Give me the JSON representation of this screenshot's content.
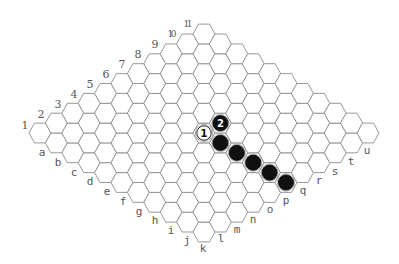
{
  "board": {
    "size": 11,
    "origin": [
      40,
      133
    ],
    "step": [
      16.4,
      9.9
    ],
    "hex_half_width": 11,
    "hex_half_height": 9.9,
    "line_color": "#8c8c8c"
  },
  "row_labels": [
    {
      "text": "1",
      "x": 25,
      "y": 129
    },
    {
      "text": "2",
      "x": 41,
      "y": 118
    },
    {
      "text": "3",
      "x": 58,
      "y": 108
    },
    {
      "text": "4",
      "x": 74,
      "y": 98
    },
    {
      "text": "5",
      "x": 90,
      "y": 88
    },
    {
      "text": "6",
      "x": 106,
      "y": 78
    },
    {
      "text": "7",
      "x": 122,
      "y": 68
    },
    {
      "text": "8",
      "x": 138,
      "y": 58
    },
    {
      "text": "9",
      "x": 155,
      "y": 48
    },
    {
      "text": "10",
      "x": 172,
      "y": 37
    },
    {
      "text": "11",
      "x": 188,
      "y": 27
    }
  ],
  "column_labels": [
    {
      "text": "a",
      "x": 42,
      "y": 156
    },
    {
      "text": "b",
      "x": 58,
      "y": 166
    },
    {
      "text": "c",
      "x": 74,
      "y": 176
    },
    {
      "text": "d",
      "x": 90,
      "y": 185
    },
    {
      "text": "e",
      "x": 107,
      "y": 195
    },
    {
      "text": "f",
      "x": 123,
      "y": 205
    },
    {
      "text": "g",
      "x": 139,
      "y": 215
    },
    {
      "text": "h",
      "x": 155,
      "y": 224
    },
    {
      "text": "i",
      "x": 171,
      "y": 234
    },
    {
      "text": "j",
      "x": 187,
      "y": 244
    },
    {
      "text": "k",
      "x": 203,
      "y": 252
    },
    {
      "text": "l",
      "x": 221,
      "y": 242
    },
    {
      "text": "m",
      "x": 237,
      "y": 233
    },
    {
      "text": "n",
      "x": 253,
      "y": 223
    },
    {
      "text": "o",
      "x": 270,
      "y": 213
    },
    {
      "text": "p",
      "x": 286,
      "y": 204
    },
    {
      "text": "q",
      "x": 303,
      "y": 194
    },
    {
      "text": "r",
      "x": 319,
      "y": 184
    },
    {
      "text": "s",
      "x": 335,
      "y": 175
    },
    {
      "text": "t",
      "x": 351,
      "y": 165
    },
    {
      "text": "u",
      "x": 367,
      "y": 154
    }
  ],
  "stones": [
    {
      "color": "white",
      "i": 5,
      "j": 5,
      "label": "1"
    },
    {
      "color": "black",
      "i": 6,
      "j": 5,
      "label": "2"
    },
    {
      "color": "black",
      "i": 5,
      "j": 6,
      "label": ""
    },
    {
      "color": "black",
      "i": 5,
      "j": 7,
      "label": ""
    },
    {
      "color": "black",
      "i": 5,
      "j": 8,
      "label": ""
    },
    {
      "color": "black",
      "i": 5,
      "j": 9,
      "label": ""
    },
    {
      "color": "black",
      "i": 5,
      "j": 10,
      "label": ""
    }
  ]
}
